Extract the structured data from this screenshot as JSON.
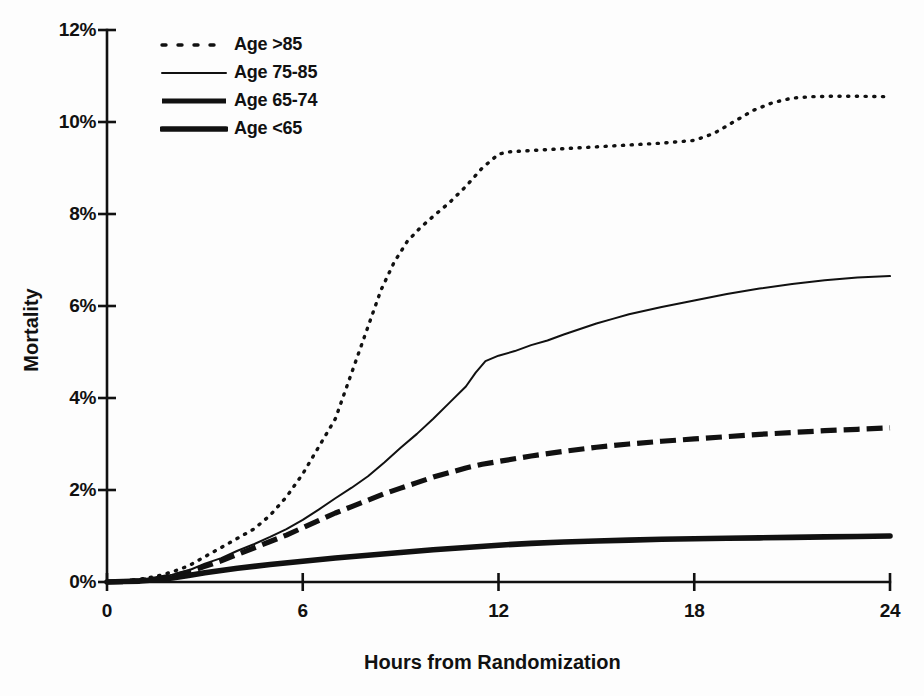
{
  "figure": {
    "background_color": "#fdfdfd",
    "ink_color": "#111111"
  },
  "axes": {
    "y_axis_title": "Mortality",
    "x_axis_title": "Hours from Randomization",
    "y_tick_labels": [
      "0%",
      "2%",
      "4%",
      "6%",
      "8%",
      "10%",
      "12%"
    ],
    "x_tick_labels": [
      "0",
      "6",
      "12",
      "18",
      "24"
    ]
  },
  "legend": {
    "position": "top-left-inside",
    "entries": [
      {
        "label": "Age >85",
        "style": "dotted",
        "line_width": 3.2
      },
      {
        "label": "Age 75-85",
        "style": "solid-thin",
        "line_width": 1.8
      },
      {
        "label": "Age 65-74",
        "style": "dashed-thick",
        "line_width": 5.0
      },
      {
        "label": "Age <65",
        "style": "solid-thick",
        "line_width": 5.5
      }
    ]
  },
  "chart_data": {
    "type": "line",
    "title": "",
    "subtitle": "",
    "xlabel": "Hours from Randomization",
    "ylabel": "Mortality",
    "xlim": [
      0,
      24
    ],
    "ylim": [
      0,
      12
    ],
    "xticks": [
      0,
      6,
      12,
      18,
      24
    ],
    "yticks": [
      0,
      2,
      4,
      6,
      8,
      10,
      12
    ],
    "y_unit": "percent",
    "grid": false,
    "legend_entries": [
      "Age >85",
      "Age 75-85",
      "Age 65-74",
      "Age <65"
    ],
    "series": [
      {
        "name": "Age >85",
        "style": "dotted",
        "final_value": 10.55,
        "x": [
          0,
          0.5,
          1.0,
          1.5,
          2.0,
          2.5,
          3.0,
          3.5,
          4.0,
          4.5,
          5.0,
          5.5,
          6.0,
          6.5,
          7.0,
          7.3,
          7.6,
          8.0,
          8.4,
          8.8,
          9.2,
          9.6,
          10.0,
          10.5,
          11.0,
          11.5,
          12.0,
          12.3,
          13.0,
          14.0,
          15.0,
          16.0,
          17.0,
          18.0,
          18.6,
          19.2,
          19.8,
          20.4,
          21.0,
          21.6,
          22.2,
          23.0,
          24.0
        ],
        "y": [
          0.0,
          0.02,
          0.06,
          0.12,
          0.22,
          0.35,
          0.55,
          0.75,
          0.95,
          1.15,
          1.45,
          1.85,
          2.35,
          2.95,
          3.55,
          4.15,
          4.75,
          5.55,
          6.35,
          6.95,
          7.4,
          7.7,
          7.95,
          8.25,
          8.6,
          9.0,
          9.3,
          9.35,
          9.38,
          9.42,
          9.46,
          9.5,
          9.54,
          9.6,
          9.75,
          10.0,
          10.25,
          10.42,
          10.52,
          10.55,
          10.56,
          10.56,
          10.55
        ]
      },
      {
        "name": "Age 75-85",
        "style": "solid-thin",
        "final_value": 6.65,
        "x": [
          0,
          0.5,
          1.0,
          1.5,
          2.0,
          2.5,
          3.0,
          3.5,
          4.0,
          4.5,
          5.0,
          5.5,
          6.0,
          6.5,
          7.0,
          7.5,
          8.0,
          8.5,
          9.0,
          9.5,
          10.0,
          10.5,
          11.0,
          11.3,
          11.6,
          12.0,
          12.5,
          13.0,
          13.5,
          14.0,
          14.5,
          15.0,
          15.5,
          16.0,
          17.0,
          18.0,
          19.0,
          20.0,
          21.0,
          22.0,
          23.0,
          24.0
        ],
        "y": [
          0.0,
          0.01,
          0.04,
          0.09,
          0.16,
          0.25,
          0.4,
          0.52,
          0.68,
          0.82,
          0.98,
          1.15,
          1.35,
          1.58,
          1.82,
          2.05,
          2.3,
          2.6,
          2.92,
          3.22,
          3.55,
          3.9,
          4.25,
          4.55,
          4.8,
          4.92,
          5.02,
          5.15,
          5.25,
          5.38,
          5.5,
          5.62,
          5.72,
          5.82,
          5.98,
          6.12,
          6.26,
          6.38,
          6.48,
          6.56,
          6.62,
          6.65
        ]
      },
      {
        "name": "Age 65-74",
        "style": "dashed-thick",
        "final_value": 3.35,
        "x": [
          0,
          0.5,
          1.0,
          1.5,
          2.0,
          2.5,
          3.0,
          3.5,
          4.0,
          4.5,
          5.0,
          5.5,
          6.0,
          6.5,
          7.0,
          7.5,
          8.0,
          8.5,
          9.0,
          9.5,
          10.0,
          10.5,
          11.0,
          11.5,
          12.0,
          13.0,
          14.0,
          15.0,
          16.0,
          17.0,
          18.0,
          19.0,
          20.0,
          21.0,
          22.0,
          23.0,
          24.0
        ],
        "y": [
          0.0,
          0.01,
          0.03,
          0.07,
          0.13,
          0.22,
          0.34,
          0.46,
          0.6,
          0.74,
          0.88,
          1.02,
          1.18,
          1.34,
          1.5,
          1.64,
          1.78,
          1.92,
          2.04,
          2.16,
          2.28,
          2.38,
          2.48,
          2.56,
          2.62,
          2.74,
          2.84,
          2.93,
          3.0,
          3.06,
          3.11,
          3.16,
          3.21,
          3.25,
          3.29,
          3.32,
          3.35
        ]
      },
      {
        "name": "Age <65",
        "style": "solid-thick",
        "final_value": 1.0,
        "x": [
          0,
          0.5,
          1.0,
          1.5,
          2.0,
          2.5,
          3.0,
          3.5,
          4.0,
          5.0,
          6.0,
          7.0,
          8.0,
          9.0,
          10.0,
          11.0,
          12.0,
          13.0,
          14.0,
          15.0,
          16.0,
          17.0,
          18.0,
          19.0,
          20.0,
          21.0,
          22.0,
          23.0,
          24.0
        ],
        "y": [
          0.0,
          0.01,
          0.02,
          0.05,
          0.09,
          0.14,
          0.2,
          0.25,
          0.3,
          0.38,
          0.45,
          0.52,
          0.58,
          0.64,
          0.7,
          0.75,
          0.8,
          0.84,
          0.87,
          0.89,
          0.91,
          0.93,
          0.94,
          0.95,
          0.96,
          0.97,
          0.98,
          0.99,
          1.0
        ]
      }
    ]
  }
}
